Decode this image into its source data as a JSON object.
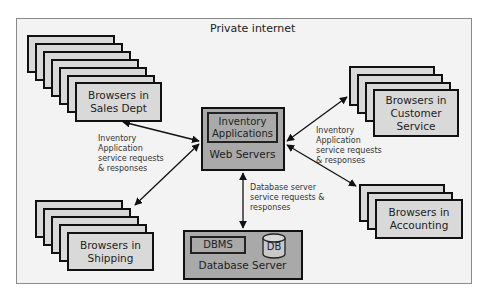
{
  "diagram": {
    "title": "Private internet",
    "web_server": {
      "app_label": "Inventory\nApplications",
      "label": "Web Servers"
    },
    "database_server": {
      "dbms_label": "DBMS",
      "db_label": "DB",
      "label": "Database Server"
    },
    "browser_groups": [
      {
        "id": "sales",
        "label": "Browsers in\nSales Dept",
        "stack_count": 7
      },
      {
        "id": "customer-service",
        "label": "Browsers in\nCustomer\nService",
        "stack_count": 4
      },
      {
        "id": "shipping",
        "label": "Browsers in\nShipping",
        "stack_count": 5
      },
      {
        "id": "accounting",
        "label": "Browsers in\nAccounting",
        "stack_count": 3
      }
    ],
    "annotations": {
      "left": "Inventory\nApplication\nservice requests\n      & responses",
      "right": "Inventory\nApplication\nservice requests\n      & responses",
      "database": "Database server\nservice requests &\nresponses"
    },
    "colors": {
      "frame_bg": "#f3f3f3",
      "browser_fill": "#d9d9d9",
      "server_fill": "#a9a9a9",
      "stroke": "#111111"
    }
  }
}
